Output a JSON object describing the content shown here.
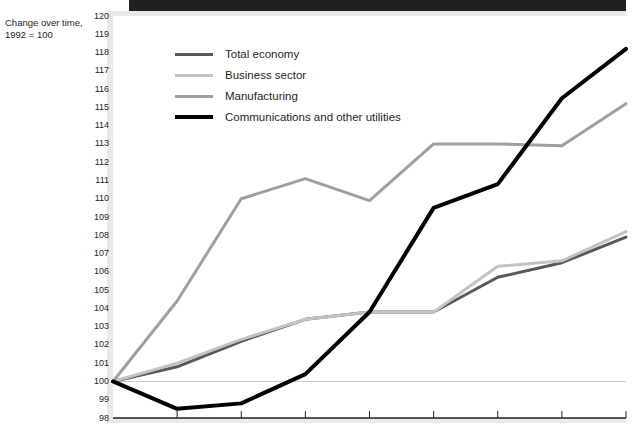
{
  "caption": {
    "line1": "Change over time,",
    "line2": "1992 = 100"
  },
  "chart_data": {
    "type": "line",
    "title": "",
    "subtitle": "",
    "xlabel": "",
    "ylabel": "Change over time, 1992 = 100",
    "ylim": [
      98,
      120
    ],
    "yticks": [
      98,
      99,
      100,
      101,
      102,
      103,
      104,
      105,
      106,
      107,
      108,
      109,
      110,
      111,
      112,
      113,
      114,
      115,
      116,
      117,
      118,
      119,
      120
    ],
    "xticks": [
      "",
      "",
      "",
      "",
      "",
      "",
      "",
      "",
      ""
    ],
    "x": [
      0,
      1,
      2,
      3,
      4,
      5,
      6,
      7,
      8
    ],
    "grid": false,
    "legend_position": "upper-left",
    "reference_line": 100,
    "series": [
      {
        "name": "Total economy",
        "color": "#58595b",
        "width": 3,
        "values": [
          100.0,
          100.8,
          102.2,
          103.4,
          103.8,
          103.8,
          105.7,
          106.5,
          107.9
        ]
      },
      {
        "name": "Business sector",
        "color": "#c3c3c4",
        "width": 3,
        "values": [
          100.0,
          101.0,
          102.3,
          103.4,
          103.8,
          103.8,
          106.3,
          106.6,
          108.2
        ]
      },
      {
        "name": "Manufacturing",
        "color": "#9e9fa1",
        "width": 3,
        "values": [
          100.0,
          104.4,
          110.0,
          111.1,
          109.9,
          113.0,
          113.0,
          112.9,
          115.2
        ]
      },
      {
        "name": "Communications and other utilities",
        "color": "#000000",
        "width": 4,
        "values": [
          100.0,
          98.5,
          98.8,
          100.4,
          103.8,
          109.5,
          110.8,
          115.5,
          118.2
        ]
      }
    ]
  }
}
